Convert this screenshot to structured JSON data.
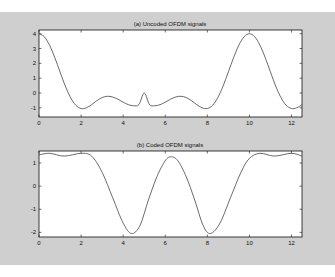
{
  "chart_data": [
    {
      "type": "line",
      "title": "(a) Uncoded OFDM signals",
      "xlabel": "",
      "ylabel": "",
      "xlim": [
        0,
        12.5
      ],
      "ylim": [
        -1.7,
        4.3
      ],
      "xticks": [
        0,
        2,
        4,
        6,
        8,
        10,
        12
      ],
      "yticks": [
        -1,
        0,
        1,
        2,
        3,
        4
      ],
      "grid": false,
      "series": [
        {
          "name": "uncoded",
          "x": [
            0,
            0.25,
            0.5,
            0.75,
            1,
            1.25,
            1.5,
            1.75,
            2,
            2.25,
            2.5,
            2.75,
            3,
            3.25,
            3.5,
            3.75,
            4,
            4.25,
            4.5,
            4.75,
            5,
            5.25,
            5.5,
            5.75,
            6,
            6.25,
            6.5,
            6.75,
            7,
            7.25,
            7.5,
            7.75,
            8,
            8.25,
            8.5,
            8.75,
            9,
            9.25,
            9.5,
            9.75,
            10,
            10.25,
            10.5,
            10.75,
            11,
            11.25,
            11.5,
            11.75,
            12,
            12.25,
            12.5
          ],
          "y": [
            4.0,
            3.8,
            3.23,
            2.39,
            1.42,
            0.47,
            -0.31,
            -0.83,
            -1.05,
            -1.0,
            -0.79,
            -0.52,
            -0.31,
            -0.22,
            -0.27,
            -0.42,
            -0.62,
            -0.79,
            -0.86,
            -0.78,
            0.0,
            -0.78,
            -0.86,
            -0.79,
            -0.62,
            -0.42,
            -0.27,
            -0.22,
            -0.31,
            -0.52,
            -0.79,
            -1.0,
            -1.05,
            -0.83,
            -0.31,
            0.47,
            1.42,
            2.39,
            3.23,
            3.8,
            4.0,
            3.8,
            3.23,
            2.39,
            1.42,
            0.47,
            -0.31,
            -0.83,
            -1.05,
            -1.0,
            -0.79
          ]
        }
      ]
    },
    {
      "type": "line",
      "title": "(b) Coded OFDM signals",
      "xlabel": "",
      "ylabel": "",
      "xlim": [
        0,
        12.5
      ],
      "ylim": [
        -2.2,
        1.5
      ],
      "xticks": [
        0,
        2,
        4,
        6,
        8,
        10,
        12
      ],
      "yticks": [
        -2,
        -1,
        0,
        1
      ],
      "grid": false,
      "series": [
        {
          "name": "coded",
          "x": [
            0,
            0.5,
            1.2,
            2.0,
            2.5,
            3.0,
            3.5,
            4.0,
            4.4,
            4.8,
            5.2,
            5.6,
            6.0,
            6.28,
            6.6,
            7.0,
            7.4,
            7.8,
            8.15,
            8.6,
            9.1,
            9.6,
            10.0,
            10.5,
            11.2,
            12.0,
            12.5
          ],
          "y": [
            1.35,
            1.42,
            1.3,
            1.42,
            1.3,
            0.6,
            -0.5,
            -1.6,
            -2.05,
            -1.7,
            -0.6,
            0.4,
            1.1,
            1.27,
            1.1,
            0.4,
            -0.6,
            -1.7,
            -2.05,
            -1.6,
            -0.5,
            0.6,
            1.2,
            1.42,
            1.3,
            1.42,
            1.3
          ]
        }
      ]
    }
  ],
  "colors": {
    "background": "#cfcfcf",
    "plot_area": "#ffffff",
    "line": "#444444",
    "axis": "#111111"
  }
}
